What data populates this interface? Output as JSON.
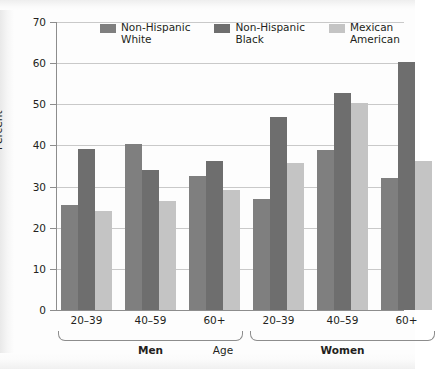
{
  "chart_data": {
    "type": "bar",
    "title": "",
    "xlabel": "Age",
    "ylabel": "Percent",
    "ylim": [
      0,
      70
    ],
    "yticks": [
      0,
      10,
      20,
      30,
      40,
      50,
      60,
      70
    ],
    "grid": true,
    "legend_position": "top-center",
    "categories": [
      "20–39",
      "40–59",
      "60+",
      "20–39",
      "40–59",
      "60+"
    ],
    "supergroups": [
      {
        "label": "Men",
        "categories": [
          "20–39",
          "40–59",
          "60+"
        ]
      },
      {
        "label": "Women",
        "categories": [
          "20–39",
          "40–59",
          "60+"
        ]
      }
    ],
    "series": [
      {
        "name": "Non-Hispanic White",
        "legend_label": "Non-Hispanic\nWhite",
        "color": "#7f7f7f",
        "values": [
          25.6,
          40.3,
          32.5,
          27.0,
          39.0,
          32.0
        ]
      },
      {
        "name": "Non-Hispanic Black",
        "legend_label": "Non-Hispanic\nBlack",
        "color": "#6e6e6e",
        "values": [
          39.2,
          34.1,
          36.2,
          47.0,
          52.8,
          60.4
        ]
      },
      {
        "name": "Mexican American",
        "legend_label": "Mexican\nAmerican",
        "color": "#c4c4c4",
        "values": [
          24.0,
          26.6,
          29.2,
          35.7,
          50.2,
          36.2
        ]
      }
    ]
  },
  "axis": {
    "y_title": "Percent",
    "x_title": "Age",
    "y_tick_labels": [
      "70",
      "60",
      "50",
      "40",
      "30",
      "20",
      "10",
      "0"
    ]
  },
  "legend": {
    "items": [
      {
        "label": "Non-Hispanic\nWhite",
        "color": "#7f7f7f"
      },
      {
        "label": "Non-Hispanic\nBlack",
        "color": "#6e6e6e"
      },
      {
        "label": "Mexican\nAmerican",
        "color": "#c4c4c4"
      }
    ]
  },
  "xaxis": {
    "tick_labels": [
      "20–39",
      "40–59",
      "60+",
      "20–39",
      "40–59",
      "60+"
    ],
    "group_labels": [
      "Men",
      "Women"
    ],
    "center_label": "Age"
  }
}
